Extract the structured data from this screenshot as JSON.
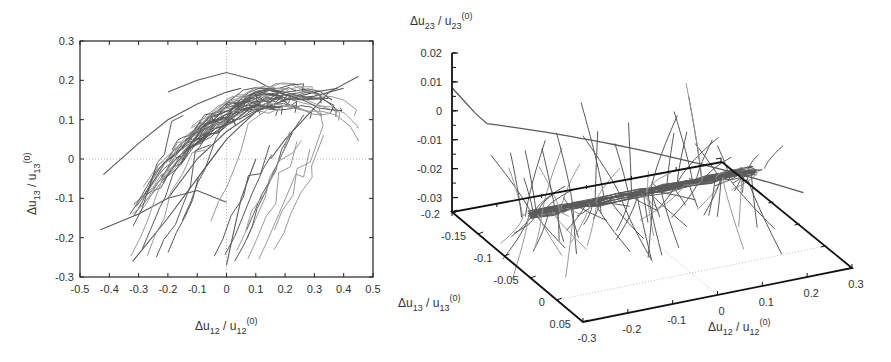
{
  "chart_data": [
    {
      "type": "line",
      "panel": "left",
      "title": "",
      "xlabel": "Δu12 / u12(0)",
      "ylabel": "Δu13 / u13(0)",
      "xlim": [
        -0.5,
        0.5
      ],
      "ylim": [
        -0.3,
        0.3
      ],
      "xticks": [
        "-0.5",
        "-0.4",
        "-0.3",
        "-0.2",
        "-0.1",
        "0",
        "0.1",
        "0.2",
        "0.3",
        "0.4",
        "0.5"
      ],
      "yticks": [
        "-0.3",
        "-0.2",
        "-0.1",
        "0",
        "0.1",
        "0.2",
        "0.3"
      ],
      "grid": "dotted zero lines at x=0 and y=0",
      "legend": "none",
      "description": "Many gray trajectory curves forming a band rising from lower-left (~(-0.3,-0.27)) to upper-right (~(0.35,0.2)), concentrated along a curved ridge peaking near (0.2,0.16)",
      "series": [
        {
          "name": "trajectory-1",
          "x": [
            -0.43,
            -0.3,
            -0.2,
            -0.1,
            0.0
          ],
          "y": [
            -0.18,
            -0.14,
            -0.1,
            -0.08,
            -0.11
          ]
        },
        {
          "name": "trajectory-2",
          "x": [
            -0.32,
            -0.2,
            -0.1,
            0.0,
            0.1,
            0.2,
            0.3,
            0.38
          ],
          "y": [
            -0.26,
            -0.15,
            -0.05,
            0.05,
            0.12,
            0.15,
            0.17,
            0.18
          ]
        },
        {
          "name": "trajectory-3",
          "x": [
            -0.2,
            -0.1,
            0.0,
            0.1,
            0.2,
            0.3,
            0.4
          ],
          "y": [
            -0.1,
            0.0,
            0.07,
            0.12,
            0.15,
            0.16,
            0.18
          ]
        },
        {
          "name": "trajectory-4",
          "x": [
            -0.42,
            -0.3,
            -0.2,
            -0.1,
            0.0,
            0.05
          ],
          "y": [
            -0.04,
            0.04,
            0.1,
            0.14,
            0.17,
            0.18
          ]
        },
        {
          "name": "trajectory-5",
          "x": [
            -0.2,
            -0.1,
            0.0,
            0.1,
            0.15
          ],
          "y": [
            0.17,
            0.2,
            0.22,
            0.2,
            0.18
          ]
        },
        {
          "name": "trajectory-6",
          "x": [
            0.0,
            0.02,
            0.05,
            0.1
          ],
          "y": [
            -0.27,
            -0.2,
            -0.1,
            0.0
          ]
        },
        {
          "name": "trajectory-7",
          "x": [
            0.15,
            0.2,
            0.25,
            0.3,
            0.35,
            0.45
          ],
          "y": [
            0.0,
            0.05,
            0.09,
            0.13,
            0.17,
            0.21
          ]
        }
      ]
    },
    {
      "type": "line",
      "panel": "right",
      "projection": "3d",
      "title": "",
      "xlabel": "Δu12 / u12(0)",
      "ylabel": "Δu13 / u13(0)",
      "zlabel": "Δu23 / u23(0)",
      "xlim": [
        -0.3,
        0.3
      ],
      "ylim": [
        -0.2,
        0.05
      ],
      "zlim": [
        -0.035,
        0.02
      ],
      "xticks": [
        "-0.3",
        "-0.2",
        "-0.1",
        "0",
        "0.1",
        "0.2",
        "0.3"
      ],
      "yticks": [
        "-0.2",
        "-0.15",
        "-0.1",
        "-0.05",
        "0",
        "0.05"
      ],
      "zticks": [
        "0.02",
        "0.01",
        "0",
        "-0.01",
        "-0.02",
        "-0.03"
      ],
      "grid": "dotted zero lines on base plane",
      "legend": "none",
      "description": "Many gray 3D trajectories converging to a dense horizontal bundle near Δu23 ≈ -0.02, with strands fanning up to ~0.01 and down to the floor; one long curve arcs across near z≈0",
      "series": [
        {
          "name": "bundle-center",
          "x": [
            -0.3,
            -0.2,
            -0.1,
            0.0,
            0.1,
            0.2,
            0.3
          ],
          "y": [
            0,
            0,
            0,
            0,
            0,
            0,
            0
          ],
          "z": [
            -0.02,
            -0.02,
            -0.02,
            -0.02,
            -0.02,
            -0.02,
            -0.02
          ]
        },
        {
          "name": "long-arc",
          "x": [
            -0.3,
            -0.25,
            -0.1,
            0.1,
            0.25
          ],
          "y": [
            -0.2,
            -0.15,
            -0.1,
            -0.05,
            0.0
          ],
          "z": [
            0.005,
            -0.003,
            -0.004,
            -0.008,
            -0.015
          ]
        }
      ]
    }
  ],
  "colors": {
    "trajectory": "#5a5a5a",
    "trajectory_light": "#9a9a9a",
    "axis": "#111111",
    "grid": "#aaaaaa",
    "text": "#333333"
  }
}
